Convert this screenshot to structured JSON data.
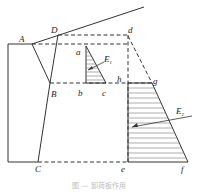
{
  "diagram": {
    "labels": {
      "A": "A",
      "B": "B",
      "C": "C",
      "D": "D",
      "a": "a",
      "b": "b",
      "c": "c",
      "d": "d",
      "e": "e",
      "f": "f",
      "g": "g",
      "h": "h",
      "E1": "E",
      "E1_sub": "1",
      "E2": "E",
      "E2_sub": "2"
    },
    "caption": "图 — 卸荷板作用"
  }
}
